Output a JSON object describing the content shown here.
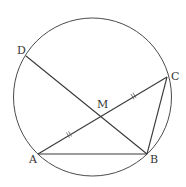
{
  "diagram": {
    "type": "circle-geometry",
    "circle": {
      "cx": 92.5,
      "cy": 97,
      "r": 79
    },
    "points": {
      "A": {
        "label": "A",
        "x": 38,
        "y": 154,
        "label_x": 29,
        "label_y": 163
      },
      "B": {
        "label": "B",
        "x": 147,
        "y": 154,
        "label_x": 150,
        "label_y": 163
      },
      "C": {
        "label": "C",
        "x": 167,
        "y": 77,
        "label_x": 171,
        "label_y": 80
      },
      "D": {
        "label": "D",
        "x": 26,
        "y": 56,
        "label_x": 17,
        "label_y": 54
      },
      "M": {
        "label": "M",
        "x": 100,
        "y": 115,
        "label_x": 97,
        "label_y": 108
      }
    },
    "segments": [
      {
        "name": "segment-AB",
        "from": "A",
        "to": "B"
      },
      {
        "name": "segment-AC",
        "from": "A",
        "to": "C"
      },
      {
        "name": "segment-DB",
        "from": "D",
        "to": "B"
      },
      {
        "name": "segment-CB",
        "from": "C",
        "to": "B"
      }
    ],
    "equal_marks": [
      {
        "name": "tick-AM",
        "segment": "AM",
        "x": 69,
        "y": 134.5
      },
      {
        "name": "tick-MC",
        "segment": "MC",
        "x": 133.5,
        "y": 96
      }
    ],
    "colors": {
      "line": "#3a3a3a",
      "circle": "#4a4a4a",
      "label": "#333333",
      "background": "#ffffff"
    }
  }
}
